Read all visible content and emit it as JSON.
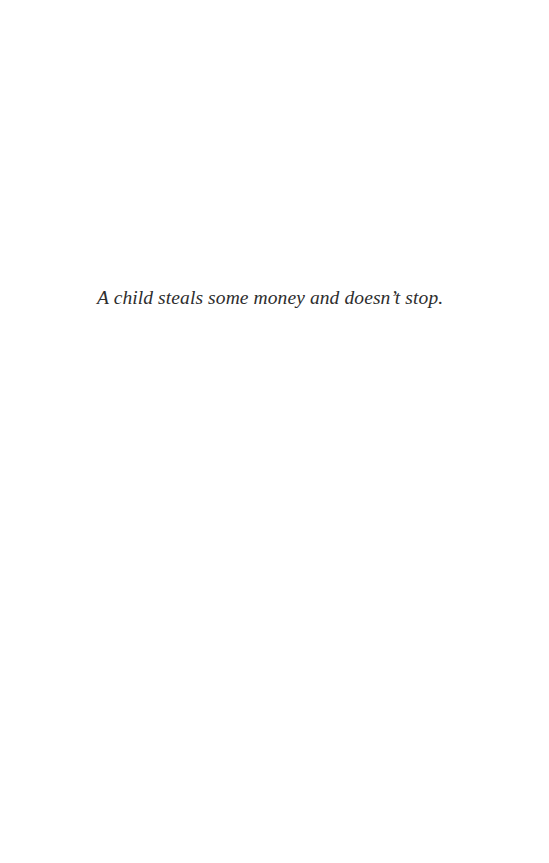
{
  "page": {
    "epigraph": "A child steals some money and doesn’t stop."
  },
  "colors": {
    "background": "#ffffff",
    "text": "#2e2e2e"
  }
}
